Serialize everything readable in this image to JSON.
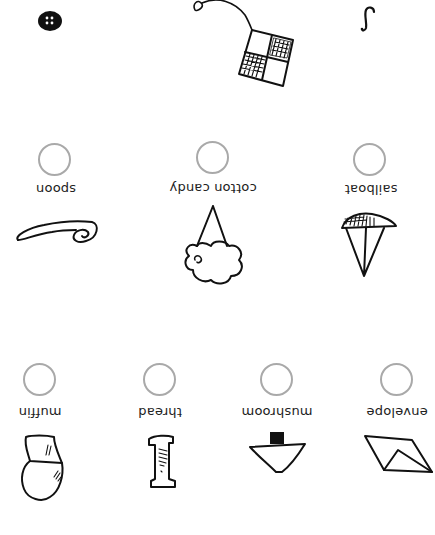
{
  "worksheet": {
    "orientation": "rotated 180 degrees",
    "top_items": [
      {
        "name": "button",
        "label": ""
      },
      {
        "name": "tea-bag",
        "label": ""
      },
      {
        "name": "hook",
        "label": ""
      }
    ],
    "middle_row": [
      {
        "label": "spoon",
        "circle": "empty"
      },
      {
        "label": "cotton candy",
        "circle": "empty"
      },
      {
        "label": "sailboat",
        "circle": "empty"
      }
    ],
    "bottom_row": [
      {
        "label": "muffin",
        "circle": "empty"
      },
      {
        "label": "thread",
        "circle": "empty"
      },
      {
        "label": "mushroom",
        "circle": "empty"
      },
      {
        "label": "envelope",
        "circle": "empty"
      }
    ],
    "colors": {
      "circle_stroke": "#a9a9a9",
      "ink": "#111111",
      "background": "#ffffff"
    }
  }
}
